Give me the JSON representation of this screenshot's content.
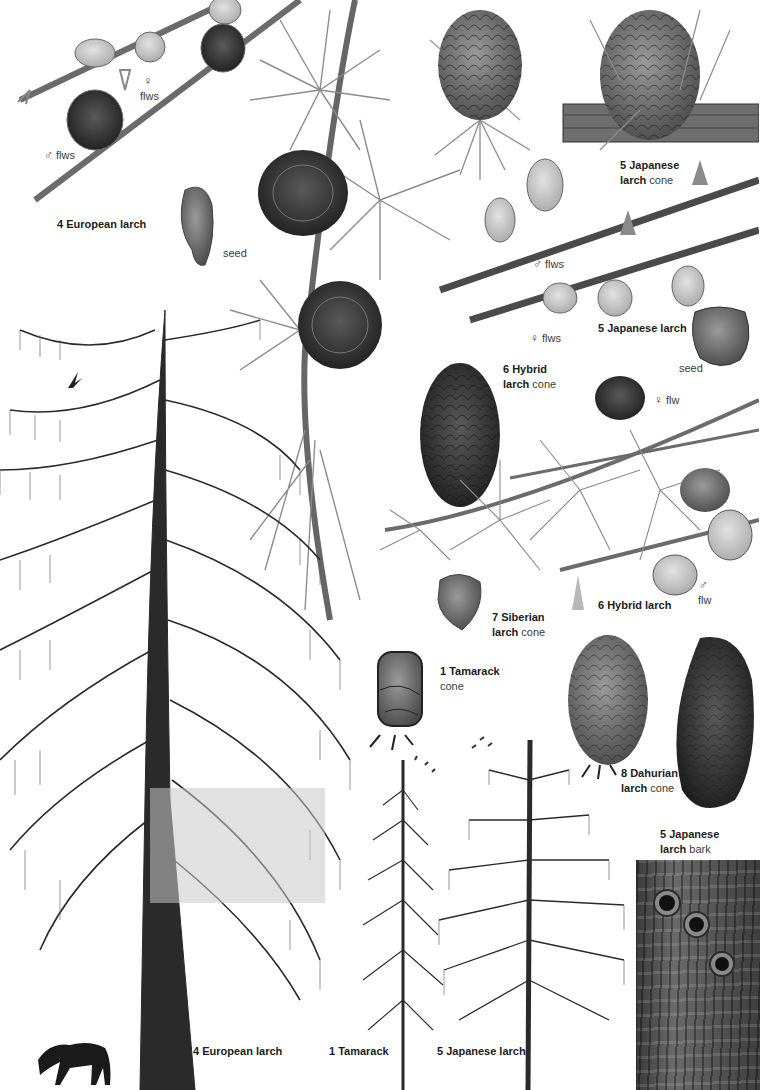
{
  "plate": {
    "background": "#ffffff",
    "ink": "#1c1c1c",
    "species": [
      {
        "number": "1",
        "name": "Tamarack"
      },
      {
        "number": "4",
        "name": "European larch"
      },
      {
        "number": "5",
        "name": "Japanese larch"
      },
      {
        "number": "6",
        "name": "Hybrid larch"
      },
      {
        "number": "7",
        "name": "Siberian larch"
      },
      {
        "number": "8",
        "name": "Dahurian larch"
      }
    ]
  },
  "labels": {
    "european_female_flws": {
      "symbol": "♀",
      "text": "flws"
    },
    "european_male_flws": {
      "symbol": "♂",
      "text": "flws"
    },
    "european_larch": {
      "bold": "4 European larch"
    },
    "european_seed": {
      "text": "seed"
    },
    "japanese_cone": {
      "bold_line1": "5 Japanese",
      "bold_line2": "larch",
      "plain": "cone"
    },
    "japanese_male_flws": {
      "symbol": "♂",
      "text": "flws"
    },
    "japanese_female_flws": {
      "symbol": "♀",
      "text": "flws"
    },
    "japanese_larch": {
      "bold": "5 Japanese larch"
    },
    "japanese_seed": {
      "text": "seed"
    },
    "hybrid_cone": {
      "bold_line1": "6 Hybrid",
      "bold_line2": "larch",
      "plain": "cone"
    },
    "hybrid_female_flw": {
      "symbol": "♀",
      "text": "flw"
    },
    "hybrid_larch": {
      "bold": "6 Hybrid larch"
    },
    "hybrid_male_flw": {
      "symbol": "♂",
      "text": "flw"
    },
    "siberian_cone": {
      "bold_line1": "7 Siberian",
      "bold_line2": "larch",
      "plain": "cone"
    },
    "tamarack_cone": {
      "bold": "1 Tamarack",
      "plain": "cone"
    },
    "dahurian_cone": {
      "bold_line1": "8 Dahurian",
      "bold_line2": "larch",
      "plain": "cone"
    },
    "japanese_bark": {
      "bold_line1": "5 Japanese",
      "bold_line2": "larch",
      "plain": "bark"
    },
    "tree_european": {
      "text": "4 European larch"
    },
    "tree_tamarack": {
      "text": "1 Tamarack"
    },
    "tree_japanese": {
      "text": "5 Japanese larch"
    }
  },
  "illustrations": [
    "european-larch-flowering-shoot",
    "european-larch-mature-cones-shoot",
    "european-larch-seed",
    "japanese-larch-cone-on-branch",
    "japanese-larch-flowering-shoots",
    "japanese-larch-seed",
    "hybrid-larch-cone",
    "hybrid-larch-shoot",
    "siberian-larch-cone",
    "tamarack-cone",
    "dahurian-larch-cones",
    "japanese-larch-bark",
    "european-larch-tree",
    "tamarack-tree",
    "japanese-larch-tree",
    "bird-silhouette",
    "deer-silhouette"
  ]
}
